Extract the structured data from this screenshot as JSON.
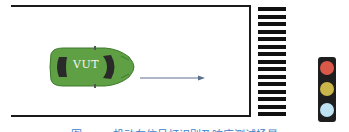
{
  "diagram": {
    "vehicle": {
      "label": "VUT",
      "body_color": "#5fa044",
      "direction": "right"
    },
    "road": {
      "line_color": "#1a1a1a"
    },
    "crosswalk": {
      "stripe_count": 15,
      "stripe_color": "#111111"
    },
    "traffic_light": {
      "lamps": [
        {
          "name": "red",
          "color": "#d9584a"
        },
        {
          "name": "yellow",
          "color": "#c9b54a"
        },
        {
          "name": "green",
          "color": "#bfe3f3"
        }
      ],
      "housing_color": "#1e1e1e"
    },
    "arrow": {
      "color": "#5a6f8f"
    },
    "caption": "图 x-xx  机动车信号灯识别及响应测试场景",
    "caption_color": "#3a7fc8"
  }
}
